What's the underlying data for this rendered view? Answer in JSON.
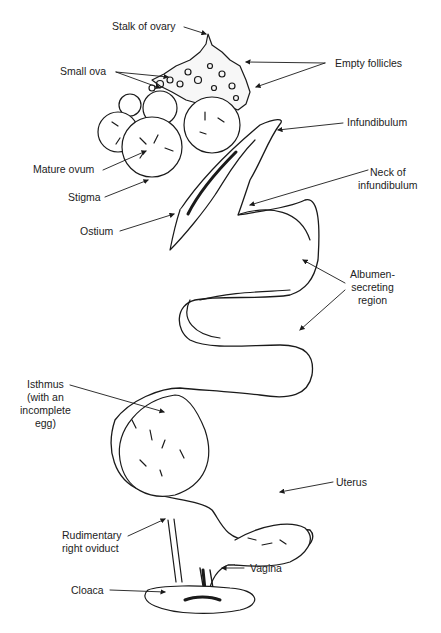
{
  "diagram": {
    "labels": {
      "stalk_of_ovary": "Stalk of ovary",
      "small_ova": "Small ova",
      "empty_follicles": "Empty follicles",
      "infundibulum": "Infundibulum",
      "mature_ovum": "Mature ovum",
      "neck_line1": "Neck of",
      "neck_line2": "infundibulum",
      "stigma": "Stigma",
      "ostium": "Ostium",
      "albumen_line1": "Albumen-",
      "albumen_line2": "secreting",
      "albumen_line3": "region",
      "isthmus_line1": "Isthmus",
      "isthmus_line2": "(with an",
      "isthmus_line3": "incomplete",
      "isthmus_line4": "egg)",
      "uterus": "Uterus",
      "rudimentary_line1": "Rudimentary",
      "rudimentary_line2": "right oviduct",
      "vagina": "Vagina",
      "cloaca": "Cloaca"
    },
    "colors": {
      "ink": "#1a1a1a",
      "background": "#ffffff"
    }
  }
}
